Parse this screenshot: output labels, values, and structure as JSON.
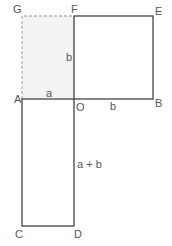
{
  "diagram": {
    "points": {
      "G": "G",
      "F": "F",
      "E": "E",
      "A": "A",
      "O": "O",
      "B": "B",
      "C": "C",
      "D": "D"
    },
    "segment_labels": {
      "FO": "b",
      "AO": "a",
      "OB": "b",
      "OD": "a + b"
    },
    "shapes": [
      {
        "name": "shaded-rectangle-AOFG",
        "style": "dashed, light gray fill",
        "fill": "#f3f3f3",
        "stroke": "#b0b0b0"
      },
      {
        "name": "square-OBEF",
        "style": "solid",
        "stroke": "#444444"
      },
      {
        "name": "rectangle-AODC",
        "style": "solid",
        "stroke": "#444444"
      }
    ]
  }
}
